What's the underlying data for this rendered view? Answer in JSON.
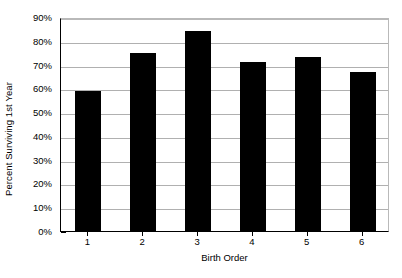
{
  "chart_data": {
    "type": "bar",
    "title": "",
    "subtitle": "",
    "xlabel": "Birth Order",
    "ylabel": "Percent Surviving 1st Year",
    "categories": [
      "1",
      "2",
      "3",
      "4",
      "5",
      "6"
    ],
    "values": [
      59,
      75,
      84,
      71,
      73,
      67
    ],
    "value_labels": [
      "59%",
      "75%",
      "84%",
      "71%",
      "73%",
      "67%"
    ],
    "ylim": [
      0,
      90
    ],
    "ytick_values": [
      0,
      10,
      20,
      30,
      40,
      50,
      60,
      70,
      80,
      90
    ],
    "ytick_labels": [
      "0%",
      "10%",
      "20%",
      "30%",
      "40%",
      "50%",
      "60%",
      "70%",
      "80%",
      "90%"
    ],
    "grid": true,
    "grid_axis": "y",
    "legend": false,
    "legend_position": "none",
    "series": [
      {
        "name": "Percent Surviving 1st Year",
        "values": [
          59,
          75,
          84,
          71,
          73,
          67
        ]
      }
    ],
    "colors": {
      "bar": "#000000",
      "grid": "#b0b0b0",
      "axis": "#000000",
      "background": "#ffffff",
      "text": "#000000"
    }
  }
}
